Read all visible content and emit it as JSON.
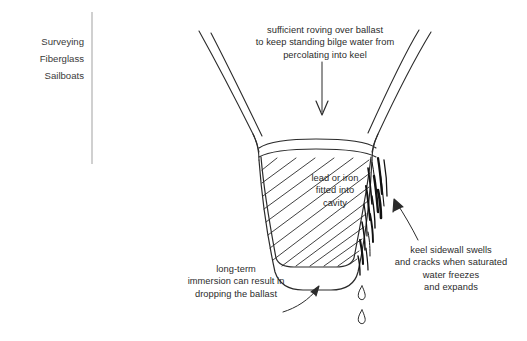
{
  "page": {
    "background": "#ffffff",
    "ink": "#2b2b2b",
    "width": 527,
    "height": 341
  },
  "header": {
    "line1": "Surveying",
    "line2": "Fiberglass",
    "line3": "Sailboats"
  },
  "annotations": {
    "top": "sufficient roving over ballast\nto keep standing bilge water from\npercolating into keel",
    "middle": "lead or iron\nfitted into\ncavity",
    "right": "keel sidewall swells\nand cracks when saturated\nwater freezes\nand expands",
    "left": "long-term\nimmersion can result in\ndropping the ballast"
  },
  "diagram": {
    "elements": [
      "hull-left-side",
      "hull-right-side",
      "roving-layer",
      "ballast-cavity-hatching",
      "keel-bottom",
      "sidewall-cracks",
      "water-droplets"
    ]
  }
}
